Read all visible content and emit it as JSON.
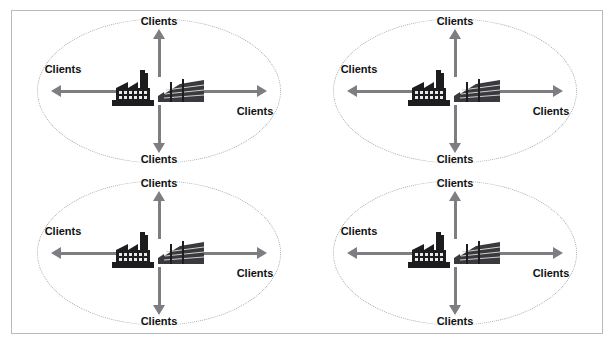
{
  "figure": {
    "title": "",
    "background_color": "#ffffff",
    "frame_color": "#b9b9bd",
    "ellipse_border_color": "#a9a9ad",
    "arrow_color": "#7d7d82",
    "label_color": "#111111",
    "layout": "2x2 grid of identical client clusters"
  },
  "clusters": [
    {
      "id": "cluster-top-left",
      "center_icon": "factory-and-office-building-icon",
      "labels": {
        "top": "Clients",
        "right": "Clients",
        "bottom": "Clients",
        "left": "Clients"
      }
    },
    {
      "id": "cluster-top-right",
      "center_icon": "factory-and-office-building-icon",
      "labels": {
        "top": "Clients",
        "right": "Clients",
        "bottom": "Clients",
        "left": "Clients"
      }
    },
    {
      "id": "cluster-bottom-left",
      "center_icon": "factory-and-office-building-icon",
      "labels": {
        "top": "Clients",
        "right": "Clients",
        "bottom": "Clients",
        "left": "Clients"
      }
    },
    {
      "id": "cluster-bottom-right",
      "center_icon": "factory-and-office-building-icon",
      "labels": {
        "top": "Clients",
        "right": "Clients",
        "bottom": "Clients",
        "left": "Clients"
      }
    }
  ]
}
